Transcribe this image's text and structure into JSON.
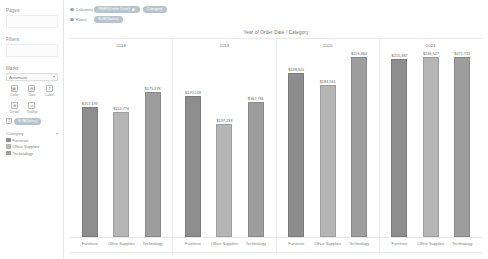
{
  "sidebar": {
    "pages": {
      "label": "Pages"
    },
    "filters": {
      "label": "Filters"
    },
    "marks": {
      "label": "Marks",
      "type_selected": "Automatic",
      "caret": "▾",
      "buttons": [
        {
          "name": "color",
          "label": "Color",
          "icon": "palette-icon",
          "glyph": "▦"
        },
        {
          "name": "size",
          "label": "Size",
          "icon": "size-icon",
          "glyph": "▤"
        },
        {
          "name": "label",
          "label": "Label",
          "icon": "label-icon",
          "glyph": "T"
        },
        {
          "name": "detail",
          "label": "Detail",
          "icon": "detail-icon",
          "glyph": "⊞"
        },
        {
          "name": "tooltip",
          "label": "Tooltip",
          "icon": "tooltip-icon",
          "glyph": "▭"
        }
      ],
      "mark_pill": {
        "icon": "text-icon",
        "glyph": "T",
        "label": "SUM(Sales)"
      }
    },
    "legend": {
      "title": "Category",
      "menu_glyph": "▾",
      "items": [
        {
          "label": "Furniture",
          "color": "#8d8d8d"
        },
        {
          "label": "Office Supplies",
          "color": "#b5b5b5"
        },
        {
          "label": "Technology",
          "color": "#9d9d9d"
        }
      ]
    }
  },
  "shelves": {
    "columns": {
      "label": "Columns",
      "pills": [
        {
          "text": "YEAR(Order Date)",
          "dot": "▾"
        },
        {
          "text": "Category",
          "dot": ""
        }
      ]
    },
    "rows": {
      "label": "Rows",
      "pills": [
        {
          "text": "SUM(Sales)",
          "dot": ""
        }
      ]
    }
  },
  "chart_data": {
    "type": "bar",
    "title": "Year of Order Date / Category",
    "xlabel": "",
    "ylabel": "",
    "ylim": [
      0,
      225000
    ],
    "grid": false,
    "legend_position": "sidebar",
    "categories": [
      "Furniture",
      "Office Supplies",
      "Technology"
    ],
    "groups": [
      "2018",
      "2019",
      "2020",
      "2021"
    ],
    "colors": {
      "Furniture": "#8d8d8d",
      "Office Supplies": "#b5b5b5",
      "Technology": "#9d9d9d"
    },
    "bars": [
      {
        "group": "2018",
        "category": "Furniture",
        "value": 157193,
        "label": "$157,193"
      },
      {
        "group": "2018",
        "category": "Office Supplies",
        "value": 151776,
        "label": "$151,776"
      },
      {
        "group": "2018",
        "category": "Technology",
        "value": 175278,
        "label": "$175,278"
      },
      {
        "group": "2019",
        "category": "Furniture",
        "value": 170518,
        "label": "$170,518"
      },
      {
        "group": "2019",
        "category": "Office Supplies",
        "value": 137233,
        "label": "$137,233"
      },
      {
        "group": "2019",
        "category": "Technology",
        "value": 162781,
        "label": "$162,781"
      },
      {
        "group": "2020",
        "category": "Furniture",
        "value": 198901,
        "label": "$198,901"
      },
      {
        "group": "2020",
        "category": "Office Supplies",
        "value": 183531,
        "label": "$183,531"
      },
      {
        "group": "2020",
        "category": "Technology",
        "value": 226364,
        "label": "$226,364"
      },
      {
        "group": "2021",
        "category": "Furniture",
        "value": 215387,
        "label": "$215,387"
      },
      {
        "group": "2021",
        "category": "Office Supplies",
        "value": 246527,
        "label": "$246,527"
      },
      {
        "group": "2021",
        "category": "Technology",
        "value": 271731,
        "label": "$271,731"
      }
    ]
  }
}
